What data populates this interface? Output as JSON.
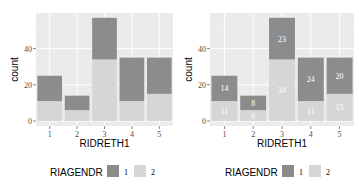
{
  "chart_data": [
    {
      "type": "bar",
      "stacked": true,
      "title": "",
      "xlabel": "RIDRETH1",
      "ylabel": "count",
      "categories": [
        "1",
        "2",
        "3",
        "4",
        "5"
      ],
      "series": [
        {
          "name": "1",
          "values": [
            14,
            8,
            23,
            24,
            20
          ],
          "color": "#8c8c8c"
        },
        {
          "name": "2",
          "values": [
            11,
            6,
            34,
            11,
            15
          ],
          "color": "#d6d6d6"
        }
      ],
      "yticks": [
        0,
        20,
        40
      ],
      "ylim": [
        0,
        60
      ],
      "legend": {
        "title": "RIAGENDR",
        "entries": [
          "1",
          "2"
        ],
        "position": "bottom"
      },
      "data_labels": false,
      "grid": true
    },
    {
      "type": "bar",
      "stacked": true,
      "title": "",
      "xlabel": "RIDRETH1",
      "ylabel": "count",
      "categories": [
        "1",
        "2",
        "3",
        "4",
        "5"
      ],
      "series": [
        {
          "name": "1",
          "values": [
            14,
            8,
            23,
            24,
            20
          ],
          "color": "#8c8c8c"
        },
        {
          "name": "2",
          "values": [
            11,
            6,
            34,
            11,
            15
          ],
          "color": "#d6d6d6"
        }
      ],
      "yticks": [
        0,
        20,
        40
      ],
      "ylim": [
        0,
        60
      ],
      "legend": {
        "title": "RIAGENDR",
        "entries": [
          "1",
          "2"
        ],
        "position": "bottom"
      },
      "data_labels": true,
      "grid": true
    }
  ],
  "panels": [
    {
      "xlabel": "RIDRETH1",
      "ylabel": "count",
      "legend_title": "RIAGENDR",
      "legend_1": "1",
      "legend_2": "2"
    },
    {
      "xlabel": "RIDRETH1",
      "ylabel": "count",
      "legend_title": "RIAGENDR",
      "legend_1": "1",
      "legend_2": "2"
    }
  ]
}
